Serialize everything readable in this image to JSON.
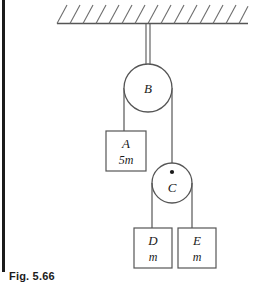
{
  "figure": {
    "caption": "Fig. 5.66",
    "background_color": "#ffffff",
    "line_color": "#555555",
    "label_color": "#1a1a1a",
    "spine_color": "#1b1b1b"
  },
  "ceiling": {
    "name": "ceiling-support",
    "hatch_count": 14
  },
  "pulleys": [
    {
      "id": "B",
      "label": "B",
      "cx": 148,
      "cy": 88,
      "r": 24,
      "fixed": true,
      "has_center_dot": false
    },
    {
      "id": "C",
      "label": "C",
      "cx": 172,
      "cy": 183,
      "r": 20,
      "fixed": false,
      "has_center_dot": true
    }
  ],
  "blocks": [
    {
      "id": "A",
      "label": "A",
      "mass": "5m",
      "x": 106,
      "y": 131,
      "w": 40,
      "h": 40
    },
    {
      "id": "D",
      "label": "D",
      "mass": "m",
      "x": 134,
      "y": 228,
      "w": 38,
      "h": 40
    },
    {
      "id": "E",
      "label": "E",
      "mass": "m",
      "x": 178,
      "y": 228,
      "w": 38,
      "h": 40
    }
  ],
  "ropes": [
    {
      "name": "ceiling-to-pulley-b",
      "from": "ceiling",
      "to": "B"
    },
    {
      "name": "pulley-b-to-block-a",
      "from": "B",
      "to": "A"
    },
    {
      "name": "pulley-b-to-pulley-c",
      "from": "B",
      "to": "C"
    },
    {
      "name": "pulley-c-to-block-d",
      "from": "C",
      "to": "D"
    },
    {
      "name": "pulley-c-to-block-e",
      "from": "C",
      "to": "E"
    }
  ]
}
